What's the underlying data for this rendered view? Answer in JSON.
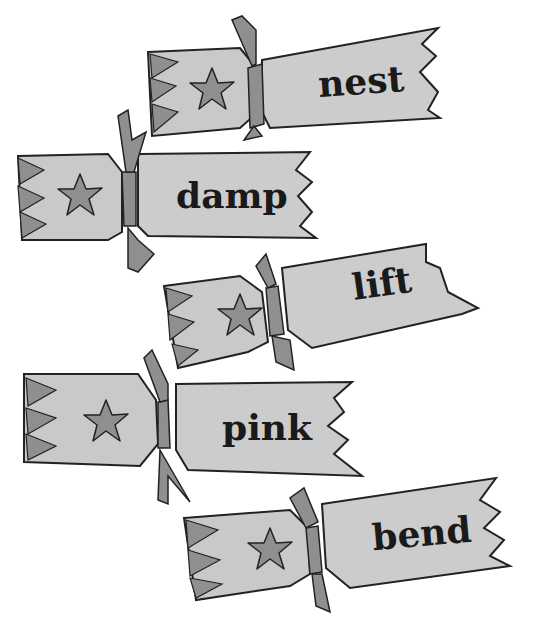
{
  "illustration": {
    "description": "Five Christmas crackers each labelled with a word",
    "colors": {
      "background": "#ffffff",
      "cracker_body": "#c9c9c9",
      "cracker_dark": "#8f8f8f",
      "outline": "#222222",
      "text": "#1a1a1a"
    },
    "crackers": [
      {
        "word": "nest",
        "icon": "star-icon"
      },
      {
        "word": "damp",
        "icon": "star-icon"
      },
      {
        "word": "lift",
        "icon": "star-icon"
      },
      {
        "word": "pink",
        "icon": "star-icon"
      },
      {
        "word": "bend",
        "icon": "star-icon"
      }
    ]
  }
}
